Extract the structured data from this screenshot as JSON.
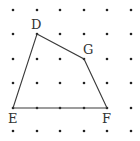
{
  "diagram": {
    "type": "dot-grid-quadrilateral",
    "grid": {
      "columns": 6,
      "rows": 6,
      "x_positions": [
        13,
        37,
        60,
        84,
        107,
        131
      ],
      "y_positions": [
        10,
        34,
        59,
        83,
        108,
        131
      ],
      "dot_color": "#222222"
    },
    "points": [
      {
        "label": "D",
        "col": 1,
        "row": 1,
        "label_dx": -6,
        "label_dy": -5
      },
      {
        "label": "G",
        "col": 3,
        "row": 2,
        "label_dx": -1,
        "label_dy": -5
      },
      {
        "label": "F",
        "col": 4,
        "row": 4,
        "label_dx": -5,
        "label_dy": 15
      },
      {
        "label": "E",
        "col": 0,
        "row": 4,
        "label_dx": -5,
        "label_dy": 15
      }
    ],
    "polygon_order": [
      "D",
      "G",
      "F",
      "E"
    ],
    "line_color": "#3a3a3a"
  }
}
